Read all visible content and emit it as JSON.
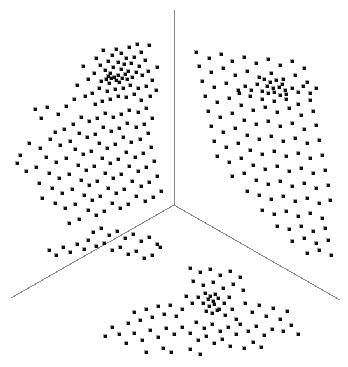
{
  "figure": {
    "title": "",
    "background_color": "#ffffff",
    "width": 348,
    "height": 367
  },
  "chart_data": {
    "type": "scatter",
    "title": "",
    "subtitle": "",
    "xlabel": "",
    "ylabel": "",
    "xlim": [
      0,
      348
    ],
    "ylim": [
      0,
      367
    ],
    "grid": false,
    "legend": null,
    "legend_position": "none",
    "annotations": [],
    "projection": "3d-trilinear",
    "marker": {
      "shape": "square",
      "size_px": 3,
      "color": "#111111",
      "edge_color": "#111111"
    },
    "axes": {
      "color": "#8a8a8a",
      "width_px": 1,
      "origin": [
        174,
        205
      ],
      "rays": [
        {
          "name": "vertical-axis",
          "end": [
            174,
            10
          ]
        },
        {
          "name": "lower-left-axis",
          "end": [
            11,
            298
          ]
        },
        {
          "name": "lower-right-axis",
          "end": [
            340,
            300
          ]
        }
      ]
    },
    "clusters": [
      {
        "name": "upper-left-cluster",
        "core": [
          110,
          77
        ],
        "n_points": 126
      },
      {
        "name": "upper-right-cluster",
        "core": [
          271,
          89
        ],
        "n_points": 124
      },
      {
        "name": "lower-cluster",
        "core": [
          212,
          300
        ],
        "n_points": 131
      }
    ],
    "n_points": 381,
    "points": [
      [
        137,
        44
      ],
      [
        129,
        47
      ],
      [
        116,
        49
      ],
      [
        149,
        45
      ],
      [
        103,
        50
      ],
      [
        121,
        53
      ],
      [
        112,
        55
      ],
      [
        141,
        52
      ],
      [
        96,
        58
      ],
      [
        126,
        58
      ],
      [
        134,
        57
      ],
      [
        108,
        61
      ],
      [
        118,
        62
      ],
      [
        145,
        60
      ],
      [
        100,
        65
      ],
      [
        124,
        64
      ],
      [
        131,
        63
      ],
      [
        113,
        67
      ],
      [
        139,
        66
      ],
      [
        105,
        70
      ],
      [
        121,
        69
      ],
      [
        128,
        71
      ],
      [
        110,
        73
      ],
      [
        136,
        72
      ],
      [
        118,
        75
      ],
      [
        125,
        74
      ],
      [
        108,
        76
      ],
      [
        114,
        77
      ],
      [
        122,
        78
      ],
      [
        111,
        78
      ],
      [
        106,
        79
      ],
      [
        116,
        80
      ],
      [
        127,
        79
      ],
      [
        132,
        77
      ],
      [
        119,
        82
      ],
      [
        109,
        83
      ],
      [
        101,
        81
      ],
      [
        142,
        75
      ],
      [
        148,
        71
      ],
      [
        94,
        73
      ],
      [
        88,
        79
      ],
      [
        152,
        80
      ],
      [
        157,
        67
      ],
      [
        83,
        66
      ],
      [
        77,
        85
      ],
      [
        146,
        86
      ],
      [
        138,
        88
      ],
      [
        130,
        85
      ],
      [
        123,
        88
      ],
      [
        115,
        89
      ],
      [
        107,
        91
      ],
      [
        99,
        88
      ],
      [
        92,
        93
      ],
      [
        85,
        96
      ],
      [
        134,
        94
      ],
      [
        126,
        97
      ],
      [
        118,
        96
      ],
      [
        110,
        99
      ],
      [
        102,
        101
      ],
      [
        95,
        104
      ],
      [
        141,
        100
      ],
      [
        150,
        96
      ],
      [
        156,
        90
      ],
      [
        74,
        99
      ],
      [
        66,
        106
      ],
      [
        58,
        114
      ],
      [
        47,
        107
      ],
      [
        41,
        118
      ],
      [
        35,
        109
      ],
      [
        146,
        108
      ],
      [
        138,
        112
      ],
      [
        129,
        110
      ],
      [
        121,
        114
      ],
      [
        113,
        117
      ],
      [
        105,
        113
      ],
      [
        97,
        118
      ],
      [
        89,
        121
      ],
      [
        81,
        117
      ],
      [
        73,
        124
      ],
      [
        64,
        129
      ],
      [
        55,
        132
      ],
      [
        152,
        118
      ],
      [
        144,
        124
      ],
      [
        136,
        127
      ],
      [
        127,
        123
      ],
      [
        119,
        128
      ],
      [
        111,
        131
      ],
      [
        103,
        127
      ],
      [
        95,
        134
      ],
      [
        87,
        137
      ],
      [
        79,
        133
      ],
      [
        70,
        141
      ],
      [
        60,
        145
      ],
      [
        50,
        139
      ],
      [
        40,
        148
      ],
      [
        29,
        143
      ],
      [
        20,
        155
      ],
      [
        148,
        133
      ],
      [
        140,
        139
      ],
      [
        131,
        142
      ],
      [
        123,
        137
      ],
      [
        115,
        144
      ],
      [
        107,
        148
      ],
      [
        99,
        143
      ],
      [
        91,
        151
      ],
      [
        83,
        154
      ],
      [
        75,
        149
      ],
      [
        66,
        158
      ],
      [
        56,
        162
      ],
      [
        46,
        157
      ],
      [
        36,
        167
      ],
      [
        26,
        171
      ],
      [
        17,
        163
      ],
      [
        151,
        147
      ],
      [
        143,
        153
      ],
      [
        135,
        157
      ],
      [
        126,
        152
      ],
      [
        118,
        159
      ],
      [
        110,
        163
      ],
      [
        102,
        158
      ],
      [
        94,
        166
      ],
      [
        86,
        170
      ],
      [
        78,
        165
      ],
      [
        69,
        174
      ],
      [
        59,
        178
      ],
      [
        49,
        173
      ],
      [
        39,
        183
      ],
      [
        154,
        161
      ],
      [
        146,
        167
      ],
      [
        138,
        171
      ],
      [
        129,
        166
      ],
      [
        121,
        174
      ],
      [
        113,
        178
      ],
      [
        105,
        173
      ],
      [
        97,
        181
      ],
      [
        89,
        185
      ],
      [
        81,
        180
      ],
      [
        72,
        189
      ],
      [
        62,
        193
      ],
      [
        52,
        188
      ],
      [
        42,
        198
      ],
      [
        157,
        176
      ],
      [
        149,
        182
      ],
      [
        141,
        186
      ],
      [
        132,
        181
      ],
      [
        124,
        189
      ],
      [
        116,
        193
      ],
      [
        108,
        188
      ],
      [
        100,
        196
      ],
      [
        92,
        200
      ],
      [
        84,
        195
      ],
      [
        75,
        204
      ],
      [
        65,
        208
      ],
      [
        55,
        203
      ],
      [
        161,
        191
      ],
      [
        153,
        197
      ],
      [
        145,
        201
      ],
      [
        136,
        196
      ],
      [
        128,
        204
      ],
      [
        120,
        208
      ],
      [
        112,
        203
      ],
      [
        104,
        211
      ],
      [
        96,
        215
      ],
      [
        88,
        210
      ],
      [
        79,
        219
      ],
      [
        69,
        223
      ],
      [
        93,
        232
      ],
      [
        101,
        228
      ],
      [
        109,
        235
      ],
      [
        117,
        231
      ],
      [
        125,
        238
      ],
      [
        133,
        234
      ],
      [
        141,
        241
      ],
      [
        149,
        237
      ],
      [
        157,
        244
      ],
      [
        88,
        240
      ],
      [
        96,
        246
      ],
      [
        104,
        243
      ],
      [
        112,
        250
      ],
      [
        120,
        247
      ],
      [
        128,
        254
      ],
      [
        136,
        251
      ],
      [
        144,
        258
      ],
      [
        152,
        255
      ],
      [
        160,
        247
      ],
      [
        84,
        249
      ],
      [
        77,
        244
      ],
      [
        70,
        252
      ],
      [
        63,
        247
      ],
      [
        56,
        255
      ],
      [
        49,
        250
      ],
      [
        196,
        52
      ],
      [
        209,
        58
      ],
      [
        221,
        54
      ],
      [
        232,
        61
      ],
      [
        244,
        57
      ],
      [
        256,
        63
      ],
      [
        268,
        59
      ],
      [
        280,
        65
      ],
      [
        292,
        61
      ],
      [
        304,
        68
      ],
      [
        199,
        66
      ],
      [
        211,
        72
      ],
      [
        223,
        68
      ],
      [
        235,
        75
      ],
      [
        247,
        71
      ],
      [
        259,
        77
      ],
      [
        271,
        73
      ],
      [
        283,
        79
      ],
      [
        295,
        75
      ],
      [
        307,
        82
      ],
      [
        264,
        79
      ],
      [
        270,
        82
      ],
      [
        276,
        80
      ],
      [
        282,
        84
      ],
      [
        267,
        86
      ],
      [
        273,
        88
      ],
      [
        279,
        87
      ],
      [
        285,
        90
      ],
      [
        262,
        91
      ],
      [
        268,
        93
      ],
      [
        274,
        92
      ],
      [
        280,
        95
      ],
      [
        286,
        94
      ],
      [
        292,
        88
      ],
      [
        298,
        92
      ],
      [
        257,
        84
      ],
      [
        251,
        90
      ],
      [
        245,
        86
      ],
      [
        239,
        93
      ],
      [
        303,
        86
      ],
      [
        310,
        93
      ],
      [
        316,
        88
      ],
      [
        202,
        81
      ],
      [
        214,
        87
      ],
      [
        226,
        83
      ],
      [
        238,
        90
      ],
      [
        250,
        96
      ],
      [
        262,
        99
      ],
      [
        274,
        101
      ],
      [
        286,
        99
      ],
      [
        298,
        104
      ],
      [
        310,
        100
      ],
      [
        205,
        96
      ],
      [
        217,
        102
      ],
      [
        229,
        98
      ],
      [
        241,
        105
      ],
      [
        253,
        110
      ],
      [
        265,
        107
      ],
      [
        277,
        112
      ],
      [
        289,
        108
      ],
      [
        301,
        115
      ],
      [
        313,
        111
      ],
      [
        208,
        111
      ],
      [
        220,
        117
      ],
      [
        232,
        113
      ],
      [
        244,
        120
      ],
      [
        256,
        124
      ],
      [
        268,
        121
      ],
      [
        280,
        126
      ],
      [
        292,
        123
      ],
      [
        304,
        129
      ],
      [
        316,
        125
      ],
      [
        211,
        126
      ],
      [
        223,
        132
      ],
      [
        235,
        128
      ],
      [
        247,
        135
      ],
      [
        259,
        139
      ],
      [
        271,
        136
      ],
      [
        283,
        141
      ],
      [
        295,
        138
      ],
      [
        307,
        143
      ],
      [
        319,
        140
      ],
      [
        214,
        141
      ],
      [
        226,
        147
      ],
      [
        238,
        143
      ],
      [
        250,
        150
      ],
      [
        262,
        154
      ],
      [
        274,
        151
      ],
      [
        286,
        156
      ],
      [
        298,
        153
      ],
      [
        310,
        158
      ],
      [
        322,
        155
      ],
      [
        217,
        156
      ],
      [
        229,
        162
      ],
      [
        241,
        158
      ],
      [
        253,
        165
      ],
      [
        265,
        169
      ],
      [
        277,
        166
      ],
      [
        289,
        171
      ],
      [
        301,
        168
      ],
      [
        313,
        173
      ],
      [
        325,
        170
      ],
      [
        232,
        176
      ],
      [
        244,
        173
      ],
      [
        256,
        180
      ],
      [
        268,
        184
      ],
      [
        280,
        181
      ],
      [
        292,
        186
      ],
      [
        304,
        183
      ],
      [
        316,
        188
      ],
      [
        328,
        185
      ],
      [
        247,
        191
      ],
      [
        259,
        195
      ],
      [
        271,
        199
      ],
      [
        283,
        196
      ],
      [
        295,
        201
      ],
      [
        307,
        198
      ],
      [
        319,
        203
      ],
      [
        330,
        200
      ],
      [
        262,
        210
      ],
      [
        274,
        214
      ],
      [
        286,
        211
      ],
      [
        298,
        216
      ],
      [
        310,
        213
      ],
      [
        322,
        218
      ],
      [
        277,
        226
      ],
      [
        289,
        229
      ],
      [
        301,
        226
      ],
      [
        313,
        231
      ],
      [
        325,
        228
      ],
      [
        292,
        241
      ],
      [
        304,
        238
      ],
      [
        316,
        243
      ],
      [
        328,
        240
      ],
      [
        307,
        253
      ],
      [
        319,
        250
      ],
      [
        331,
        255
      ],
      [
        190,
        268
      ],
      [
        200,
        272
      ],
      [
        210,
        269
      ],
      [
        220,
        275
      ],
      [
        230,
        271
      ],
      [
        240,
        277
      ],
      [
        193,
        281
      ],
      [
        203,
        285
      ],
      [
        213,
        282
      ],
      [
        223,
        288
      ],
      [
        233,
        284
      ],
      [
        243,
        290
      ],
      [
        205,
        293
      ],
      [
        210,
        296
      ],
      [
        215,
        294
      ],
      [
        208,
        299
      ],
      [
        213,
        301
      ],
      [
        218,
        298
      ],
      [
        203,
        303
      ],
      [
        209,
        306
      ],
      [
        214,
        304
      ],
      [
        219,
        309
      ],
      [
        206,
        311
      ],
      [
        212,
        313
      ],
      [
        217,
        310
      ],
      [
        224,
        303
      ],
      [
        229,
        297
      ],
      [
        198,
        297
      ],
      [
        192,
        303
      ],
      [
        186,
        296
      ],
      [
        225,
        315
      ],
      [
        232,
        309
      ],
      [
        236,
        319
      ],
      [
        182,
        309
      ],
      [
        176,
        316
      ],
      [
        170,
        305
      ],
      [
        164,
        314
      ],
      [
        158,
        306
      ],
      [
        152,
        317
      ],
      [
        146,
        309
      ],
      [
        140,
        320
      ],
      [
        134,
        312
      ],
      [
        128,
        323
      ],
      [
        245,
        303
      ],
      [
        252,
        312
      ],
      [
        259,
        305
      ],
      [
        266,
        316
      ],
      [
        273,
        308
      ],
      [
        280,
        319
      ],
      [
        287,
        311
      ],
      [
        196,
        322
      ],
      [
        204,
        328
      ],
      [
        212,
        324
      ],
      [
        220,
        331
      ],
      [
        228,
        327
      ],
      [
        236,
        334
      ],
      [
        190,
        333
      ],
      [
        198,
        340
      ],
      [
        206,
        336
      ],
      [
        214,
        343
      ],
      [
        222,
        339
      ],
      [
        230,
        346
      ],
      [
        182,
        327
      ],
      [
        174,
        334
      ],
      [
        166,
        328
      ],
      [
        158,
        337
      ],
      [
        150,
        330
      ],
      [
        142,
        340
      ],
      [
        134,
        333
      ],
      [
        126,
        343
      ],
      [
        240,
        324
      ],
      [
        248,
        331
      ],
      [
        256,
        326
      ],
      [
        264,
        335
      ],
      [
        272,
        329
      ],
      [
        190,
        349
      ],
      [
        200,
        354
      ],
      [
        163,
        348
      ],
      [
        171,
        352
      ],
      [
        146,
        352
      ],
      [
        119,
        334
      ],
      [
        112,
        327
      ],
      [
        105,
        336
      ],
      [
        253,
        342
      ],
      [
        261,
        347
      ],
      [
        244,
        348
      ],
      [
        283,
        331
      ],
      [
        291,
        325
      ],
      [
        298,
        334
      ]
    ]
  }
}
